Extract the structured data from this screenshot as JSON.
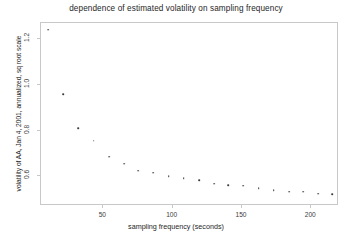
{
  "chart_data": {
    "type": "scatter",
    "title": "dependence of estimated volatility on sampling frequency",
    "xlabel": "sampling frequency (seconds)",
    "ylabel": "volatility of AA, Jan 4, 2001, annualized, sq root scale",
    "xlim": [
      5,
      220
    ],
    "ylim": [
      0.47,
      1.27
    ],
    "xticks": [
      50,
      100,
      150,
      200
    ],
    "xtick_labels": [
      "50",
      "100",
      "150",
      "200"
    ],
    "yticks": [
      0.6,
      0.8,
      1.0,
      1.2
    ],
    "ytick_labels": [
      "0.6",
      "0.8",
      "1.0",
      "1.2"
    ],
    "grid": false,
    "legend": null,
    "marker": "point",
    "marker_color": "#3a3a3a",
    "x": [
      10,
      21,
      32,
      43,
      54,
      65,
      75,
      86,
      97,
      108,
      119,
      130,
      140,
      151,
      162,
      173,
      184,
      194,
      205,
      215
    ],
    "y": [
      1.24,
      0.96,
      0.81,
      0.755,
      0.685,
      0.655,
      0.625,
      0.615,
      0.6,
      0.592,
      0.582,
      0.568,
      0.562,
      0.558,
      0.548,
      0.538,
      0.533,
      0.532,
      0.524,
      0.522
    ],
    "values": [
      1.24,
      0.96,
      0.81,
      0.755,
      0.685,
      0.655,
      0.625,
      0.615,
      0.6,
      0.592,
      0.582,
      0.568,
      0.562,
      0.558,
      0.548,
      0.538,
      0.533,
      0.532,
      0.524,
      0.522
    ]
  }
}
